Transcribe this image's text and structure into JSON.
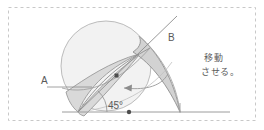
{
  "canvas": {
    "width": 264,
    "height": 130,
    "background": "#ffffff",
    "selection_border": {
      "style": "dashed",
      "color": "#c8c8c8",
      "x": 8,
      "y": 7,
      "width": 248,
      "height": 114
    }
  },
  "diagram": {
    "colors": {
      "circle_fill": "#f2f2f2",
      "circle_stroke": "#b4b4b4",
      "lens_fill": "#d9d9d9",
      "lens_stroke": "#9a9a9a",
      "wedge_fill": "#d2d2d2",
      "wedge_stroke": "#8f8f8f",
      "line": "#8c8c8c",
      "baseline": "#9c9c9c",
      "marker": "#4d4d4d",
      "text": "#5a5a5a"
    },
    "labels": {
      "point_a": "A",
      "point_b": "B",
      "angle": "45°"
    },
    "geometry": {
      "vertex_x": 78,
      "vertex_y": 112,
      "baseline_y": 112,
      "baseline_start_x": 62,
      "baseline_end_x": 230,
      "circle_center_x": 106,
      "circle_center_y": 66,
      "circle_radius": 45,
      "angle_degrees": 45,
      "right_foot_x": 180
    },
    "markers": [
      {
        "name": "lens-control-point",
        "x": 117,
        "y": 76
      },
      {
        "name": "baseline-midpoint",
        "x": 129,
        "y": 112
      }
    ]
  },
  "annotation": {
    "note_line_1": "移動",
    "note_line_2": "させる。"
  }
}
